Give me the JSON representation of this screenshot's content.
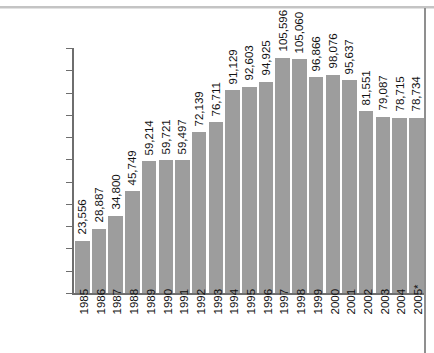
{
  "chart_data": {
    "type": "bar",
    "title": "",
    "subtitle": "",
    "xlabel": "",
    "ylabel": "",
    "categories": [
      "1985",
      "1986",
      "1987",
      "1988",
      "1989",
      "1990",
      "1991",
      "1992",
      "1993",
      "1994",
      "1995",
      "1996",
      "1997",
      "1998",
      "1999",
      "2000",
      "2001",
      "2002",
      "2003",
      "2004",
      "2005*"
    ],
    "values": [
      23556,
      28887,
      34800,
      45749,
      59214,
      59721,
      59497,
      72139,
      76711,
      91129,
      92603,
      94925,
      105596,
      105060,
      96866,
      98076,
      95637,
      81551,
      79087,
      78715,
      78734
    ],
    "value_labels": [
      "23,556",
      "28,887",
      "34,800",
      "45,749",
      "59,214",
      "59,721",
      "59,497",
      "72,139",
      "76,711",
      "91,129",
      "92,603",
      "94,925",
      "105,596",
      "105,060",
      "96,866",
      "98,076",
      "95,637",
      "81,551",
      "79,087",
      "78,715",
      "78,734"
    ],
    "ylim": [
      0,
      110000
    ],
    "ytick_values": [
      0,
      10000,
      20000,
      30000,
      40000,
      50000,
      60000,
      70000,
      80000,
      90000,
      100000,
      110000
    ],
    "ytick_labels": [
      "0",
      "10,000",
      "20,000",
      "30,000",
      "40,000",
      "50,000",
      "60,000",
      "70,000",
      "80,000",
      "90,000",
      "100,000",
      "110,000"
    ],
    "grid": false,
    "legend": null,
    "bar_color": "#9d9d9d",
    "axis_color": "#6e6e6e",
    "value_label_rotation": "vertical",
    "category_label_rotation": "vertical"
  }
}
